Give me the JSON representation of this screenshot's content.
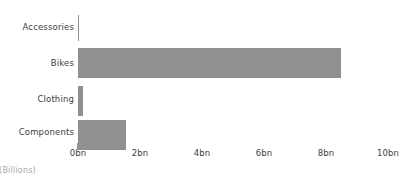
{
  "chart_data": {
    "type": "bar",
    "orientation": "horizontal",
    "title": "",
    "subtitle": "",
    "xlabel": "(Billions)",
    "ylabel": "",
    "categories": [
      "Accessories",
      "Bikes",
      "Clothing",
      "Components"
    ],
    "values": [
      0.06,
      8.5,
      0.2,
      1.58
    ],
    "series": [
      {
        "name": "Sales",
        "values": [
          0.06,
          8.5,
          0.2,
          1.58
        ]
      }
    ],
    "xlim": [
      0,
      10
    ],
    "ylim": null,
    "xticks": [
      0,
      2,
      4,
      6,
      8,
      10
    ],
    "xtick_labels": [
      "0bn",
      "2bn",
      "4bn",
      "6bn",
      "8bn",
      "10bn"
    ],
    "grid": false,
    "legend": null,
    "legend_position": "none",
    "bar_color": "#909090",
    "background_color": "#ffffff",
    "label_color": "#404040",
    "axis_title_color": "#a8a8a8"
  },
  "axis": {
    "title": "(Billions)",
    "ticks": [
      {
        "label": "0bn",
        "value": 0
      },
      {
        "label": "2bn",
        "value": 2
      },
      {
        "label": "4bn",
        "value": 4
      },
      {
        "label": "6bn",
        "value": 6
      },
      {
        "label": "8bn",
        "value": 8
      },
      {
        "label": "10bn",
        "value": 10
      }
    ]
  },
  "bars": [
    {
      "label": "Accessories",
      "value": 0.06
    },
    {
      "label": "Bikes",
      "value": 8.5
    },
    {
      "label": "Clothing",
      "value": 0.2
    },
    {
      "label": "Components",
      "value": 1.58
    }
  ]
}
